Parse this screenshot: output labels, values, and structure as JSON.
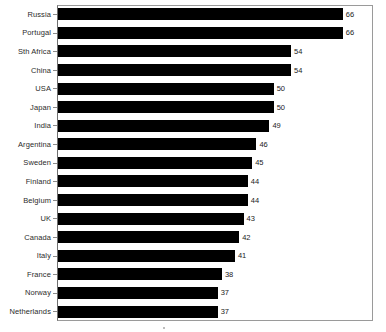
{
  "chart_data": {
    "type": "bar",
    "orientation": "horizontal",
    "title": "",
    "subtitle": "",
    "xlabel": "",
    "ylabel": "",
    "legend": [],
    "grid": false,
    "xlim": [
      0,
      70
    ],
    "bar_color": "#000000",
    "frame_color": "#9a9a9a",
    "categories": [
      "Russia",
      "Portugal",
      "Sth Africa",
      "China",
      "USA",
      "Japan",
      "India",
      "Argentina",
      "Sweden",
      "Finland",
      "Belgium",
      "UK",
      "Canada",
      "Italy",
      "France",
      "Norway",
      "Netherlands"
    ],
    "values": [
      66,
      66,
      54,
      54,
      50,
      50,
      49,
      46,
      45,
      44,
      44,
      43,
      42,
      41,
      38,
      37,
      37
    ],
    "data_labels": [
      "66",
      "66",
      "54",
      "54",
      "50",
      "50",
      "49",
      "46",
      "45",
      "44",
      "44",
      "43",
      "42",
      "41",
      "38",
      "37",
      "37"
    ]
  }
}
